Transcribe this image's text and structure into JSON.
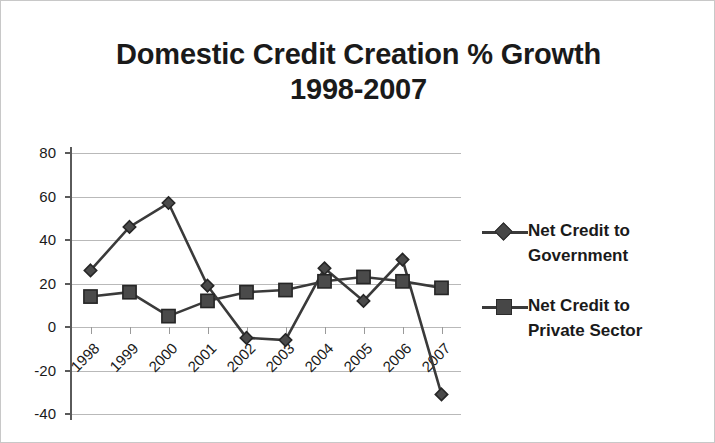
{
  "chart_data": {
    "type": "line",
    "title": "Domestic Credit Creation % Growth",
    "subtitle": "1998-2007",
    "title_line1": "Domestic Credit Creation % Growth",
    "title_line2": "1998-2007",
    "xlabel": "",
    "ylabel": "",
    "categories": [
      "1998",
      "1999",
      "2000",
      "2001",
      "2002",
      "2003",
      "2004",
      "2005",
      "2006",
      "2007"
    ],
    "ylim": [
      -40,
      80
    ],
    "ytick_values": [
      80,
      60,
      40,
      20,
      0,
      -20,
      -40
    ],
    "ytick_labels": [
      "80",
      "60",
      "40",
      "20",
      "0",
      "-20",
      "-40"
    ],
    "grid": true,
    "legend_position": "right",
    "series": [
      {
        "name": "Net Credit to Government",
        "name_line1": "Net Credit to",
        "name_line2": "Government",
        "marker": "diamond",
        "color": "#3a3a3a",
        "values": [
          26,
          46,
          57,
          19,
          -5,
          -6,
          27,
          12,
          31,
          -31
        ]
      },
      {
        "name": "Net Credit to Private Sector",
        "name_line1": "Net Credit to",
        "name_line2": "Private Sector",
        "marker": "square",
        "color": "#3a3a3a",
        "values": [
          14,
          16,
          5,
          12,
          16,
          17,
          21,
          23,
          21,
          18
        ]
      }
    ]
  },
  "colors": {
    "series_line": "#3a3a3a",
    "gridline": "#b9b9b9",
    "axis": "#5a5a5a",
    "text": "#1a1a1a",
    "background": "#ffffff",
    "border": "#c8c8c8"
  }
}
